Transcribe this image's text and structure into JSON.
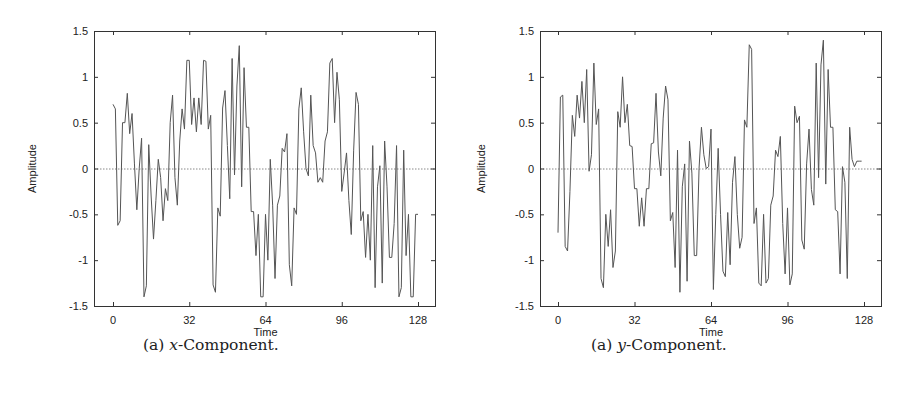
{
  "figures": [
    {
      "id": "left",
      "caption_prefix": "(a) ",
      "caption_var": "x",
      "caption_suffix": "-Component.",
      "xlabel": "Time",
      "ylabel": "Amplitude",
      "xticks": [
        "0",
        "32",
        "64",
        "96",
        "128"
      ],
      "yticks": [
        "1.5",
        "1",
        "0.5",
        "0",
        "-0.5",
        "-1",
        "-1.5"
      ]
    },
    {
      "id": "right",
      "caption_prefix": "(a) ",
      "caption_var": "y",
      "caption_suffix": "-Component.",
      "xlabel": "Time",
      "ylabel": "Amplitude",
      "xticks": [
        "0",
        "32",
        "64",
        "96",
        "128"
      ],
      "yticks": [
        "1.5",
        "1",
        "0.5",
        "0",
        "-0.5",
        "-1",
        "-1.5"
      ]
    }
  ],
  "chart_data": [
    {
      "type": "line",
      "title": "(a) x-Component.",
      "xlabel": "Time",
      "ylabel": "Amplitude",
      "xlim": [
        0,
        128
      ],
      "ylim": [
        -1.5,
        1.5
      ],
      "xticks": [
        0,
        32,
        64,
        96,
        128
      ],
      "yticks": [
        -1.5,
        -1,
        -0.5,
        0,
        0.5,
        1,
        1.5
      ],
      "grid": false,
      "reference_line": {
        "y": 0,
        "style": "dotted"
      },
      "note": "Values are approximate, traced from the visible peaks and troughs.",
      "series": [
        {
          "name": "x-Component",
          "x_start": 0,
          "x_step": 1,
          "values": [
            0.7,
            0.65,
            -0.62,
            -0.57,
            0.5,
            0.5,
            0.82,
            0.38,
            0.6,
            0.05,
            -0.45,
            0.0,
            0.33,
            -1.4,
            -1.28,
            0.26,
            -0.3,
            -0.77,
            -0.35,
            0.1,
            -0.1,
            -0.57,
            -0.22,
            -0.35,
            0.5,
            0.8,
            -0.1,
            -0.4,
            0.3,
            0.65,
            0.43,
            1.18,
            1.18,
            0.48,
            0.77,
            0.4,
            0.77,
            0.48,
            1.18,
            1.17,
            0.43,
            0.58,
            -1.27,
            -1.35,
            -0.43,
            -0.52,
            0.66,
            0.85,
            0.25,
            -0.33,
            1.2,
            -0.07,
            0.9,
            1.34,
            -0.2,
            1.1,
            0.45,
            0.45,
            -0.47,
            -0.47,
            -0.95,
            -0.5,
            -1.4,
            -1.4,
            -0.5,
            -1.0,
            0.1,
            -0.4,
            -1.2,
            -0.4,
            -0.3,
            0.22,
            0.18,
            0.38,
            -1.05,
            -1.28,
            -0.43,
            -0.5,
            0.65,
            0.88,
            0.4,
            0.0,
            -0.08,
            0.8,
            0.25,
            0.17,
            -0.15,
            -0.1,
            -0.15,
            0.3,
            0.4,
            1.15,
            1.2,
            0.5,
            1.05,
            0.75,
            -0.25,
            -0.05,
            0.17,
            -0.35,
            -0.72,
            0.2,
            0.83,
            0.7,
            -0.57,
            -0.47,
            -0.97,
            -0.5,
            -1.0,
            0.25,
            -1.3,
            -0.2,
            0.03,
            -1.25,
            0.3,
            -0.2,
            -0.97,
            -0.97,
            -0.6,
            0.25,
            -1.4,
            -1.3,
            0.2,
            -0.95,
            -0.5,
            -1.4,
            -1.4,
            -0.5,
            -0.5
          ]
        }
      ]
    },
    {
      "type": "line",
      "title": "(a) y-Component.",
      "xlabel": "Time",
      "ylabel": "Amplitude",
      "xlim": [
        0,
        128
      ],
      "ylim": [
        -1.5,
        1.5
      ],
      "xticks": [
        0,
        32,
        64,
        96,
        128
      ],
      "yticks": [
        -1.5,
        -1,
        -0.5,
        0,
        0.5,
        1,
        1.5
      ],
      "grid": false,
      "reference_line": {
        "y": 0,
        "style": "dotted"
      },
      "note": "Values are approximate, traced from the visible peaks and troughs.",
      "series": [
        {
          "name": "y-Component",
          "x_start": 0,
          "x_step": 1,
          "values": [
            -0.7,
            0.78,
            0.8,
            -0.85,
            -0.9,
            -0.25,
            0.58,
            0.35,
            0.8,
            0.55,
            0.95,
            0.5,
            1.08,
            -0.03,
            0.15,
            1.15,
            0.48,
            0.65,
            -1.2,
            -1.3,
            -0.5,
            -0.85,
            -0.45,
            -1.08,
            -0.9,
            0.62,
            0.45,
            1.0,
            0.5,
            0.7,
            0.25,
            0.24,
            -0.22,
            -0.22,
            -0.63,
            -0.32,
            -0.63,
            -0.22,
            -0.22,
            0.27,
            0.28,
            0.82,
            0.18,
            -0.08,
            0.55,
            0.9,
            0.75,
            -0.57,
            -0.48,
            -1.08,
            0.2,
            -1.35,
            -0.2,
            0.05,
            -1.23,
            0.3,
            -0.05,
            -0.95,
            -0.95,
            0.0,
            0.45,
            0.15,
            0.0,
            0.02,
            0.43,
            -1.32,
            -0.5,
            0.22,
            -0.5,
            -1.12,
            -1.18,
            -0.48,
            -1.05,
            -0.15,
            0.13,
            -0.5,
            -0.87,
            -0.75,
            0.53,
            0.45,
            1.35,
            1.3,
            -0.6,
            -0.43,
            -1.25,
            -1.28,
            -0.5,
            -1.25,
            -1.2,
            -0.4,
            -0.3,
            0.2,
            0.13,
            0.35,
            -0.6,
            -1.15,
            -0.43,
            -1.27,
            -1.15,
            0.68,
            0.5,
            0.57,
            -0.78,
            -0.88,
            0.05,
            0.43,
            -0.23,
            -0.4,
            1.15,
            -0.1,
            1.13,
            1.4,
            -0.17,
            1.08,
            0.45,
            0.45,
            -0.45,
            -0.47,
            -1.15,
            0.02,
            -0.15,
            -1.2,
            0.45,
            0.1,
            0.02,
            0.08,
            0.08,
            0.08
          ]
        }
      ]
    }
  ]
}
